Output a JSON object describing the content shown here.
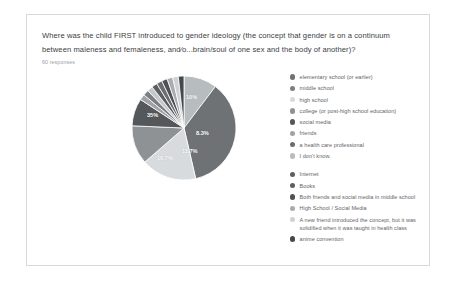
{
  "card": {
    "question": "Where was the child FIRST introduced to gender ideology (the concept that gender is on a continuum between maleness and femaleness, and⁄o...brain/soul of one sex and the body of another)?",
    "response_count": "60 responses"
  },
  "chart_data": {
    "type": "pie",
    "title": "Where was the child FIRST introduced to gender ideology (the concept that gender is on a continuum between maleness and femaleness, and⁄o...brain/soul of one sex and the body of another)?",
    "subtitle": "60 responses",
    "total_responses": 60,
    "legend_position": "right",
    "value_labels_shown": [
      "10%",
      "8.3%",
      "11.7%",
      "16.7%",
      "35%"
    ],
    "categories": [
      "elementary school (or earlier)",
      "middle school",
      "high school",
      "college (or post-high school education)",
      "social media",
      "friends",
      "a health care professional",
      "I don't know.",
      "Internet",
      "Books",
      "Both friends and social media in middle school",
      "High School / Social Media",
      "A new friend introduced the concept, but it was solidified when it was taught in health class",
      "anime convention"
    ],
    "values": [
      10,
      35,
      16.7,
      11.7,
      8.3,
      1.7,
      1.7,
      1.7,
      1.7,
      1.7,
      1.7,
      1.7,
      1.7,
      1.7
    ],
    "colors": [
      "#b7bcbf",
      "#6e7275",
      "#d8dbdd",
      "#8e9295",
      "#54585a",
      "#9fa3a6",
      "#7b7f82",
      "#c6c9cb",
      "#5b5f61",
      "#6a6e70",
      "#4e5254",
      "#a8acae",
      "#cfd2d4",
      "#45494b"
    ]
  },
  "legend": {
    "groups": [
      {
        "items": [
          {
            "label": "elementary school (or earlier)",
            "color": "#6e7275"
          },
          {
            "label": "middle school",
            "color": "#7b7f82"
          },
          {
            "label": "high school",
            "color": "#d8dbdd"
          },
          {
            "label": "college (or post-high school education)",
            "color": "#8e9295"
          },
          {
            "label": "social media",
            "color": "#54585a"
          },
          {
            "label": "friends",
            "color": "#9fa3a6"
          },
          {
            "label": "a health care professional",
            "color": "#6a6e70"
          },
          {
            "label": "I don't know.",
            "color": "#b7bcbf"
          }
        ]
      },
      {
        "items": [
          {
            "label": "Internet",
            "color": "#5b5f61"
          },
          {
            "label": "Books",
            "color": "#5b5f61"
          },
          {
            "label": "Both friends and social media in middle school",
            "color": "#4e5254"
          },
          {
            "label": "High School / Social Media",
            "color": "#a8acae"
          },
          {
            "label": "A new friend introduced the concept, but it was solidified when it was taught in health class",
            "color": "#cfd2d4"
          },
          {
            "label": "anime convention",
            "color": "#45494b"
          }
        ]
      }
    ]
  },
  "pie_labels": [
    {
      "text": "10%",
      "x": 56,
      "y": 20
    },
    {
      "text": "8.3%",
      "x": 66,
      "y": 56
    },
    {
      "text": "11.7%",
      "x": 52,
      "y": 74
    },
    {
      "text": "16.7%",
      "x": 27,
      "y": 81
    },
    {
      "text": "35%",
      "x": 17,
      "y": 38
    }
  ]
}
